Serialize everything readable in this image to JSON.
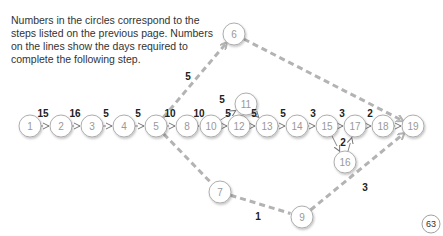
{
  "intro_text": "Numbers in the circles correspond to the steps listed on the previous page. Numbers on the lines show the days required to complete the following step.",
  "page_number": "63",
  "nodes": [
    {
      "id": "1",
      "x": 30,
      "y": 126
    },
    {
      "id": "2",
      "x": 61,
      "y": 126
    },
    {
      "id": "3",
      "x": 92,
      "y": 126
    },
    {
      "id": "4",
      "x": 124,
      "y": 126
    },
    {
      "id": "5",
      "x": 156,
      "y": 126
    },
    {
      "id": "8",
      "x": 187,
      "y": 126
    },
    {
      "id": "10",
      "x": 211,
      "y": 126
    },
    {
      "id": "12",
      "x": 239,
      "y": 126
    },
    {
      "id": "13",
      "x": 267,
      "y": 126
    },
    {
      "id": "14",
      "x": 297,
      "y": 126
    },
    {
      "id": "15",
      "x": 327,
      "y": 126
    },
    {
      "id": "17",
      "x": 355,
      "y": 126
    },
    {
      "id": "18",
      "x": 383,
      "y": 126
    },
    {
      "id": "19",
      "x": 413,
      "y": 126
    },
    {
      "id": "11",
      "x": 246,
      "y": 104
    },
    {
      "id": "16",
      "x": 345,
      "y": 162
    },
    {
      "id": "6",
      "x": 234,
      "y": 34
    },
    {
      "id": "7",
      "x": 220,
      "y": 192
    },
    {
      "id": "9",
      "x": 302,
      "y": 217
    }
  ],
  "edges": [
    {
      "from": "1",
      "to": "2",
      "days": "15",
      "style": "solid"
    },
    {
      "from": "2",
      "to": "3",
      "days": "16",
      "style": "solid"
    },
    {
      "from": "3",
      "to": "4",
      "days": "5",
      "style": "solid"
    },
    {
      "from": "4",
      "to": "5",
      "days": "5",
      "style": "solid"
    },
    {
      "from": "5",
      "to": "8",
      "days": "10",
      "style": "solid"
    },
    {
      "from": "8",
      "to": "10",
      "days": "10",
      "style": "solid"
    },
    {
      "from": "10",
      "to": "12",
      "days": "5",
      "style": "solid"
    },
    {
      "from": "10",
      "to": "11",
      "days": "5",
      "style": "solid"
    },
    {
      "from": "11",
      "to": "13",
      "days": "",
      "style": "solid"
    },
    {
      "from": "12",
      "to": "13",
      "days": "5",
      "style": "solid"
    },
    {
      "from": "13",
      "to": "14",
      "days": "5",
      "style": "solid"
    },
    {
      "from": "14",
      "to": "15",
      "days": "3",
      "style": "solid"
    },
    {
      "from": "15",
      "to": "17",
      "days": "3",
      "style": "solid"
    },
    {
      "from": "15",
      "to": "16",
      "days": "2",
      "style": "solid"
    },
    {
      "from": "16",
      "to": "17",
      "days": "",
      "style": "solid"
    },
    {
      "from": "17",
      "to": "18",
      "days": "2",
      "style": "solid"
    },
    {
      "from": "18",
      "to": "19",
      "days": "",
      "style": "solid"
    },
    {
      "from": "5",
      "to": "6",
      "days": "5",
      "style": "dashed"
    },
    {
      "from": "6",
      "to": "19",
      "days": "",
      "style": "dashed"
    },
    {
      "from": "5",
      "to": "7",
      "days": "",
      "style": "dashed"
    },
    {
      "from": "7",
      "to": "9",
      "days": "1",
      "style": "dashed"
    },
    {
      "from": "9",
      "to": "19",
      "days": "3",
      "style": "dashed"
    }
  ],
  "edge_labels": [
    {
      "text": "15",
      "x": 43,
      "y": 117
    },
    {
      "text": "16",
      "x": 75,
      "y": 117
    },
    {
      "text": "5",
      "x": 106,
      "y": 117
    },
    {
      "text": "5",
      "x": 138,
      "y": 117
    },
    {
      "text": "10",
      "x": 170,
      "y": 117
    },
    {
      "text": "10",
      "x": 199,
      "y": 117
    },
    {
      "text": "5",
      "x": 222,
      "y": 103
    },
    {
      "text": "5",
      "x": 228,
      "y": 117
    },
    {
      "text": "5",
      "x": 254,
      "y": 117
    },
    {
      "text": "5",
      "x": 283,
      "y": 117
    },
    {
      "text": "3",
      "x": 313,
      "y": 117
    },
    {
      "text": "3",
      "x": 342,
      "y": 117
    },
    {
      "text": "2",
      "x": 370,
      "y": 117
    },
    {
      "text": "2",
      "x": 343,
      "y": 146
    },
    {
      "text": "5",
      "x": 188,
      "y": 80
    },
    {
      "text": "1",
      "x": 258,
      "y": 220
    },
    {
      "text": "3",
      "x": 365,
      "y": 191
    }
  ]
}
